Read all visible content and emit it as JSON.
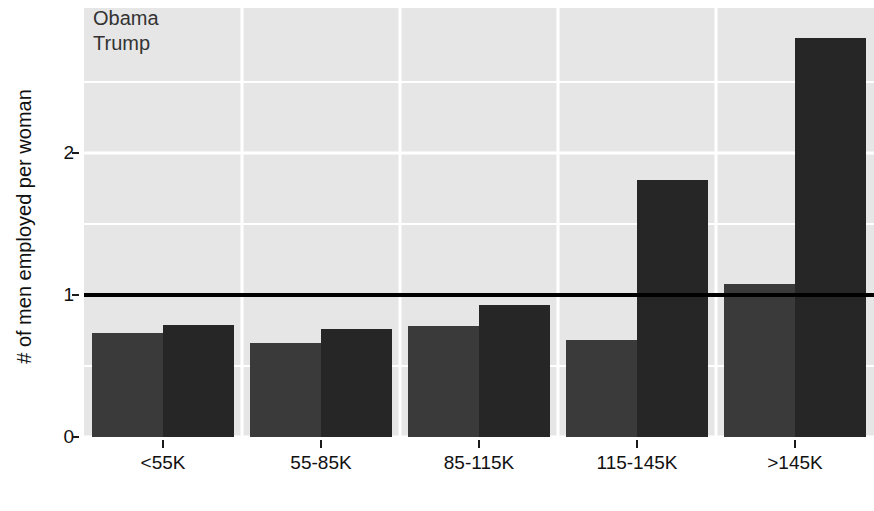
{
  "chart_data": {
    "type": "bar",
    "title": "",
    "xlabel": "",
    "ylabel": "# of men employed per woman",
    "categories": [
      "<55K",
      "55-85K",
      "85-115K",
      "115-145K",
      ">145K"
    ],
    "series": [
      {
        "name": "Obama",
        "color": "#3a3a3a",
        "values": [
          0.73,
          0.66,
          0.78,
          0.68,
          1.08
        ]
      },
      {
        "name": "Trump",
        "color": "#262626",
        "values": [
          0.79,
          0.76,
          0.93,
          1.81,
          2.81
        ]
      }
    ],
    "ylim": [
      0,
      3.05
    ],
    "yticks": [
      0,
      1,
      2
    ],
    "ytick_labels": [
      "0",
      "1",
      "2"
    ],
    "grid": true,
    "legend_position": "top-left",
    "annotations": [
      {
        "type": "hline",
        "y": 1,
        "color": "#000000",
        "label": "parity line"
      }
    ],
    "panel_background": "#e6e6e6",
    "gridline_color": "#ffffff"
  },
  "legend": {
    "entries": [
      {
        "label": "Obama"
      },
      {
        "label": "Trump"
      }
    ]
  },
  "axes": {
    "y_title": "# of men employed per woman"
  }
}
